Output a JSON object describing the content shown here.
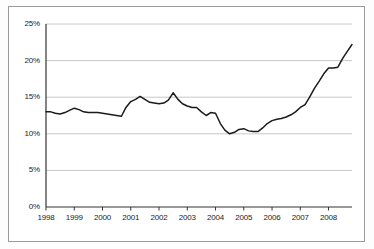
{
  "chart_data": {
    "type": "line",
    "title": "",
    "subtitle": "",
    "xlabel": "",
    "ylabel": "",
    "grid": true,
    "legend": false,
    "legend_position": "none",
    "line_color": "#1a1a1a",
    "grid_color": "#c8c8c8",
    "axis_color": "#333333",
    "background_color": "#ffffff",
    "border_color": "#9a9a9a",
    "xlim": [
      1998.0,
      2008.83
    ],
    "ylim": [
      0,
      25
    ],
    "yticks": [
      0,
      5,
      10,
      15,
      20,
      25
    ],
    "ytick_labels": [
      "0%",
      "5%",
      "10%",
      "15%",
      "20%",
      "25%"
    ],
    "xticks": [
      1998,
      1999,
      2000,
      2001,
      2002,
      2003,
      2004,
      2005,
      2006,
      2007,
      2008
    ],
    "xtick_labels": [
      "1998",
      "1999",
      "2000",
      "2001",
      "2002",
      "2003",
      "2004",
      "2005",
      "2006",
      "2007",
      "2008"
    ],
    "series": [
      {
        "name": "rate",
        "x": [
          1998.0,
          1998.17,
          1998.33,
          1998.5,
          1998.67,
          1998.83,
          1999.0,
          1999.17,
          1999.33,
          1999.5,
          1999.67,
          1999.83,
          2000.0,
          2000.17,
          2000.33,
          2000.5,
          2000.67,
          2000.83,
          2001.0,
          2001.17,
          2001.33,
          2001.5,
          2001.67,
          2001.83,
          2002.0,
          2002.17,
          2002.33,
          2002.5,
          2002.67,
          2002.83,
          2003.0,
          2003.17,
          2003.33,
          2003.5,
          2003.67,
          2003.83,
          2004.0,
          2004.17,
          2004.33,
          2004.5,
          2004.67,
          2004.83,
          2005.0,
          2005.17,
          2005.33,
          2005.5,
          2005.67,
          2005.83,
          2006.0,
          2006.17,
          2006.33,
          2006.5,
          2006.67,
          2006.83,
          2007.0,
          2007.17,
          2007.33,
          2007.5,
          2007.67,
          2007.83,
          2008.0,
          2008.17,
          2008.33,
          2008.5,
          2008.67,
          2008.83
        ],
        "values": [
          13.0,
          13.0,
          12.8,
          12.7,
          12.9,
          13.2,
          13.5,
          13.3,
          13.0,
          12.9,
          12.9,
          12.9,
          12.8,
          12.7,
          12.6,
          12.5,
          12.4,
          13.6,
          14.4,
          14.7,
          15.1,
          14.7,
          14.3,
          14.2,
          14.1,
          14.2,
          14.6,
          15.6,
          14.7,
          14.1,
          13.8,
          13.6,
          13.6,
          13.0,
          12.5,
          12.9,
          12.8,
          11.4,
          10.5,
          10.0,
          10.2,
          10.6,
          10.7,
          10.4,
          10.3,
          10.3,
          10.8,
          11.4,
          11.8,
          12.0,
          12.1,
          12.3,
          12.6,
          13.0,
          13.6,
          14.0,
          15.0,
          16.2,
          17.2,
          18.2,
          19.0,
          19.0,
          19.1,
          20.3,
          21.3,
          22.2
        ]
      }
    ]
  }
}
